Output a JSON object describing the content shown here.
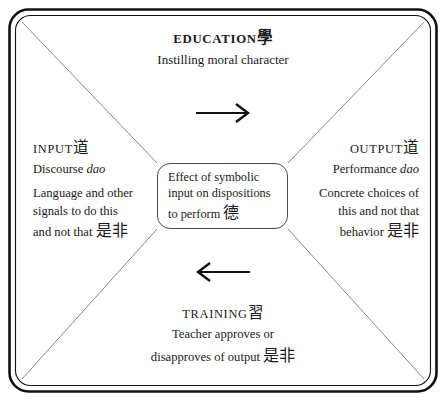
{
  "diagram": {
    "frame_color": "#111111",
    "diagonal_color": "#777777",
    "arrow_color": "#111111",
    "text_color": "#1a1a1a",
    "background": "#ffffff"
  },
  "top": {
    "heading_word": "Education",
    "heading_han": "學",
    "line1": "Instilling moral character"
  },
  "left": {
    "heading_word": "Input",
    "heading_han": "道",
    "line1_plain": "Discourse ",
    "line1_italic": "dao",
    "line2": "Language and other",
    "line3": "signals to do this",
    "line4_plain": "and not that ",
    "line4_han": "是非"
  },
  "right": {
    "heading_word": "Output",
    "heading_han": "道",
    "line1_plain": "Performance ",
    "line1_italic": "dao",
    "line2": "Concrete choices of",
    "line3": "this and not that",
    "line4_plain": "behavior ",
    "line4_han": "是非"
  },
  "bottom": {
    "heading_word": "Training",
    "heading_han": "習",
    "line1": "Teacher approves or",
    "line2_plain": "disapproves of output ",
    "line2_han": "是非"
  },
  "center": {
    "line1": "Effect of symbolic",
    "line2": "input on dispositions",
    "line3_plain": "to perform ",
    "line3_han": "德"
  },
  "arrows": {
    "top_arrow": "arrow-right",
    "bottom_arrow": "arrow-left"
  }
}
